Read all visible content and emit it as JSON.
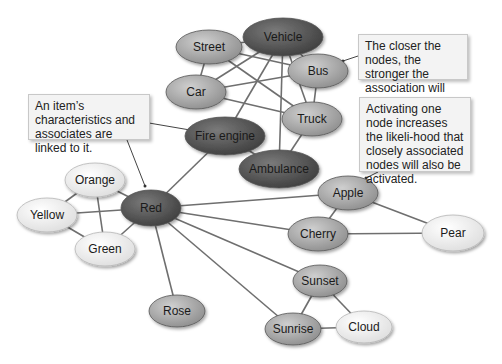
{
  "diagram": {
    "type": "semantic-network",
    "colors": {
      "background": "#ffffff",
      "edge": "#6f6f6f",
      "node_dark": "#5a5a5a",
      "node_medium": "#a9a9a9",
      "node_light": "#f0f0f0",
      "callout_bg": "#f3f3f3",
      "callout_border": "#c8c8c8"
    },
    "nodes": [
      {
        "id": "vehicle",
        "label": "Vehicle",
        "x": 283,
        "y": 37,
        "rx": 40,
        "ry": 19,
        "shade": "dark"
      },
      {
        "id": "street",
        "label": "Street",
        "x": 209,
        "y": 47,
        "rx": 33,
        "ry": 17,
        "shade": "medium"
      },
      {
        "id": "bus",
        "label": "Bus",
        "x": 318,
        "y": 71,
        "rx": 30,
        "ry": 17,
        "shade": "medium"
      },
      {
        "id": "car",
        "label": "Car",
        "x": 196,
        "y": 92,
        "rx": 30,
        "ry": 17,
        "shade": "medium"
      },
      {
        "id": "truck",
        "label": "Truck",
        "x": 312,
        "y": 119,
        "rx": 30,
        "ry": 17,
        "shade": "medium"
      },
      {
        "id": "fire_engine",
        "label": "Fire engine",
        "x": 225,
        "y": 136,
        "rx": 40,
        "ry": 19,
        "shade": "dark"
      },
      {
        "id": "ambulance",
        "label": "Ambulance",
        "x": 279,
        "y": 169,
        "rx": 40,
        "ry": 19,
        "shade": "dark"
      },
      {
        "id": "red",
        "label": "Red",
        "x": 151,
        "y": 208,
        "rx": 30,
        "ry": 18,
        "shade": "dark"
      },
      {
        "id": "orange",
        "label": "Orange",
        "x": 95,
        "y": 180,
        "rx": 30,
        "ry": 17,
        "shade": "light"
      },
      {
        "id": "yellow",
        "label": "Yellow",
        "x": 47,
        "y": 215,
        "rx": 30,
        "ry": 17,
        "shade": "light"
      },
      {
        "id": "green",
        "label": "Green",
        "x": 105,
        "y": 249,
        "rx": 30,
        "ry": 17,
        "shade": "light"
      },
      {
        "id": "apple",
        "label": "Apple",
        "x": 348,
        "y": 193,
        "rx": 30,
        "ry": 17,
        "shade": "medium"
      },
      {
        "id": "cherry",
        "label": "Cherry",
        "x": 318,
        "y": 234,
        "rx": 30,
        "ry": 17,
        "shade": "medium"
      },
      {
        "id": "pear",
        "label": "Pear",
        "x": 453,
        "y": 233,
        "rx": 31,
        "ry": 18,
        "shade": "light"
      },
      {
        "id": "sunset",
        "label": "Sunset",
        "x": 320,
        "y": 281,
        "rx": 27,
        "ry": 16,
        "shade": "medium"
      },
      {
        "id": "sunrise",
        "label": "Sunrise",
        "x": 293,
        "y": 329,
        "rx": 28,
        "ry": 16,
        "shade": "medium"
      },
      {
        "id": "cloud",
        "label": "Cloud",
        "x": 364,
        "y": 327,
        "rx": 28,
        "ry": 16,
        "shade": "light"
      },
      {
        "id": "rose",
        "label": "Rose",
        "x": 177,
        "y": 311,
        "rx": 28,
        "ry": 16,
        "shade": "medium"
      }
    ],
    "edges": [
      [
        "street",
        "vehicle"
      ],
      [
        "street",
        "car"
      ],
      [
        "street",
        "bus"
      ],
      [
        "street",
        "truck"
      ],
      [
        "vehicle",
        "car"
      ],
      [
        "vehicle",
        "bus"
      ],
      [
        "vehicle",
        "truck"
      ],
      [
        "vehicle",
        "fire_engine"
      ],
      [
        "vehicle",
        "ambulance"
      ],
      [
        "car",
        "bus"
      ],
      [
        "car",
        "truck"
      ],
      [
        "bus",
        "truck"
      ],
      [
        "truck",
        "ambulance"
      ],
      [
        "fire_engine",
        "ambulance"
      ],
      [
        "fire_engine",
        "red"
      ],
      [
        "red",
        "orange"
      ],
      [
        "red",
        "yellow"
      ],
      [
        "red",
        "green"
      ],
      [
        "orange",
        "yellow"
      ],
      [
        "orange",
        "green"
      ],
      [
        "yellow",
        "green"
      ],
      [
        "red",
        "apple"
      ],
      [
        "red",
        "cherry"
      ],
      [
        "red",
        "sunset"
      ],
      [
        "red",
        "sunrise"
      ],
      [
        "red",
        "rose"
      ],
      [
        "apple",
        "cherry"
      ],
      [
        "apple",
        "pear"
      ],
      [
        "cherry",
        "pear"
      ],
      [
        "sunset",
        "sunrise"
      ],
      [
        "sunset",
        "cloud"
      ],
      [
        "sunrise",
        "cloud"
      ]
    ],
    "callouts": [
      {
        "id": "linked",
        "text": "An item’s characteristics and associates are linked to it.",
        "x": 28,
        "y": 94,
        "w": 122,
        "h": 46,
        "pointers": [
          {
            "x1": 149,
            "y1": 123,
            "x2": 190,
            "y2": 130
          },
          {
            "x1": 127,
            "y1": 140,
            "x2": 145,
            "y2": 186
          }
        ]
      },
      {
        "id": "closer",
        "text": "The closer the nodes, the stronger the association will be.",
        "x": 358,
        "y": 34,
        "w": 110,
        "h": 46,
        "pointers": [
          {
            "x1": 358,
            "y1": 56,
            "x2": 343,
            "y2": 61
          }
        ]
      },
      {
        "id": "activating",
        "text": "Activating one node increases the likeli-hood that closely associated nodes will also be activated.",
        "x": 359,
        "y": 97,
        "w": 112,
        "h": 75,
        "pointers": [
          {
            "x1": 378,
            "y1": 172,
            "x2": 366,
            "y2": 178
          }
        ]
      }
    ]
  }
}
